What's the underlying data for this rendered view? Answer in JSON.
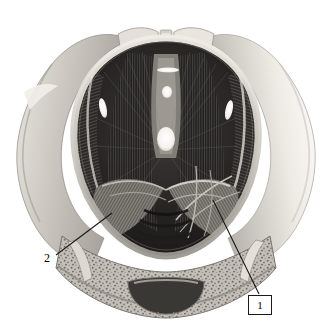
{
  "figure": {
    "kind": "anatomical-illustration",
    "rendering": "grayscale halftone engraving",
    "canvas": {
      "width": 329,
      "height": 336
    },
    "background_color": "#ffffff"
  },
  "palette": {
    "background": "#ffffff",
    "bone_highlight": "#f2f0ec",
    "bone_light": "#d8d5cf",
    "bone_mid": "#b9b5ae",
    "bone_shadow": "#8e8a84",
    "cancellous_speckle": "#6f6b66",
    "muscle_light": "#9c9892",
    "muscle_mid": "#57544f",
    "muscle_dark": "#2e2c2a",
    "muscle_deepest": "#161514",
    "aperture_white": "#fbfbf9",
    "leader_line": "#1a1a1a",
    "label_text": "#000000",
    "label_box_border": "#1a1a1a",
    "label_box_fill": "#ffffff"
  },
  "annotations": {
    "callouts": [
      {
        "id": "callout-1",
        "label": "1",
        "style": "boxed",
        "box": {
          "x": 248,
          "y": 295,
          "width": 22,
          "height": 18
        },
        "leader": {
          "from": {
            "x": 259,
            "y": 294
          },
          "to": {
            "x": 213,
            "y": 200
          }
        }
      },
      {
        "id": "callout-2",
        "label": "2",
        "style": "plain",
        "text_pos": {
          "x": 44,
          "y": 252
        },
        "leader": {
          "from": {
            "x": 56,
            "y": 255
          },
          "to": {
            "x": 112,
            "y": 213
          }
        }
      }
    ]
  },
  "landmarks": {
    "apertures": [
      {
        "name": "midline-slit-superior",
        "cx": 168,
        "cy": 70,
        "rx": 11,
        "ry": 2.5
      },
      {
        "name": "midline-oval-superior",
        "cx": 167,
        "cy": 92,
        "rx": 5,
        "ry": 6
      },
      {
        "name": "midline-hiatus-central",
        "cx": 166,
        "cy": 139,
        "rx": 9,
        "ry": 12
      },
      {
        "name": "left-obturator-slit",
        "cx": 103,
        "cy": 108,
        "rx": 4,
        "ry": 10
      },
      {
        "name": "right-obturator-slit",
        "cx": 229,
        "cy": 110,
        "rx": 4,
        "ry": 10
      }
    ],
    "regions": [
      {
        "name": "left-iliac-wing",
        "tone": "#cecac3"
      },
      {
        "name": "right-iliac-wing",
        "tone": "#eeebe6"
      },
      {
        "name": "pubic-symphysis",
        "tone": "#e6e2db"
      },
      {
        "name": "levator-ani-sheet",
        "tone": "#3a3835"
      },
      {
        "name": "coccygeus-fan",
        "tone": "#8e8a83"
      },
      {
        "name": "sacral-cancellous-bone",
        "tone": "#b3afa8"
      },
      {
        "name": "sacral-canal",
        "tone": "#44413d"
      }
    ]
  }
}
